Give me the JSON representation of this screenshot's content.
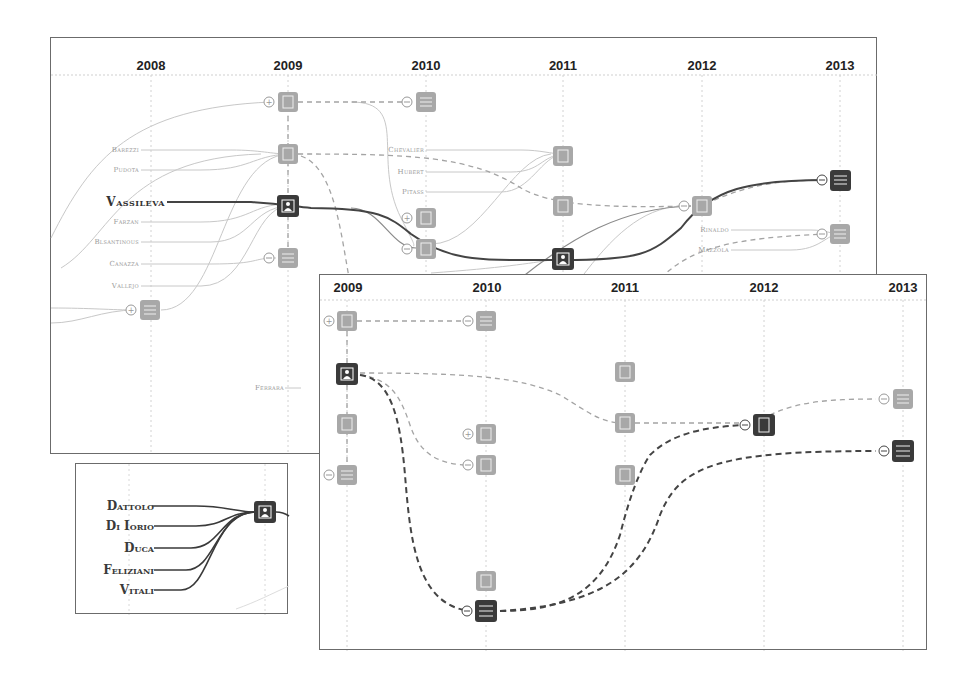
{
  "colors": {
    "dark_node": "#3a3a3a",
    "light_node": "#a8a8a8",
    "grid": "#cfcfcf",
    "faint_line": "#c4c4c4",
    "dark_line": "#444444",
    "mid_line": "#8a8a8a",
    "border": "#6b6b6b"
  },
  "back_panel": {
    "years": [
      "2008",
      "2009",
      "2010",
      "2011",
      "2012",
      "2013"
    ],
    "highlight_author": "Vassileva",
    "author_labels_left": [
      "Barezzi",
      "Pudota",
      "Farzan",
      "Blsantinous",
      "Canazza",
      "Vallejo"
    ],
    "author_labels_mid": [
      "Chevalier",
      "Hubert",
      "Pitass"
    ],
    "author_labels_right": [
      "Rinaldo",
      "Mazzola"
    ],
    "author_label_bottom": "Ferrara"
  },
  "front_panel": {
    "years": [
      "2009",
      "2010",
      "2011",
      "2012",
      "2013"
    ]
  },
  "inset_panel": {
    "authors": [
      "Dattolo",
      "Di Iorio",
      "Duca",
      "Feliziani",
      "Vitali"
    ]
  }
}
